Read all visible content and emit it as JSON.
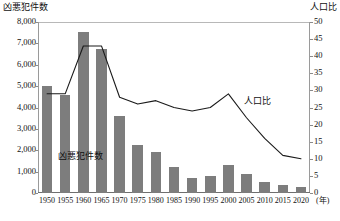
{
  "chart_data": {
    "type": "bar",
    "title": "",
    "xlabel": "(年)",
    "ylabel": "凶悪犯件数",
    "y2label": "人口比",
    "ylim": [
      0,
      8000
    ],
    "y2lim": [
      0,
      50
    ],
    "grid": false,
    "legend_position": "inline-annotation",
    "categories": [
      "1950",
      "1955",
      "1960",
      "1965",
      "1970",
      "1975",
      "1980",
      "1985",
      "1990",
      "1995",
      "2000",
      "2005",
      "2010",
      "2015",
      "2020"
    ],
    "yticks_left": [
      "0",
      "1,000",
      "2,000",
      "3,000",
      "4,000",
      "5,000",
      "6,000",
      "7,000",
      "8,000"
    ],
    "yticks_right": [
      "0",
      "5",
      "10",
      "15",
      "20",
      "25",
      "30",
      "35",
      "40",
      "45",
      "50"
    ],
    "series": [
      {
        "name": "凶悪犯件数",
        "type": "bar",
        "axis": "left",
        "color": "#7d7d7d",
        "values": [
          5000,
          4600,
          7550,
          6750,
          3600,
          2250,
          1900,
          1200,
          700,
          800,
          1300,
          900,
          500,
          380,
          300
        ]
      },
      {
        "name": "人口比",
        "type": "line",
        "axis": "right",
        "color": "#1a1a1a",
        "values": [
          29,
          29,
          43,
          43,
          28,
          26,
          27,
          25,
          24,
          25,
          29,
          22,
          16,
          11,
          10
        ]
      }
    ],
    "annotations": [
      {
        "text": "凶悪犯件数",
        "target": "bar-series"
      },
      {
        "text": "人口比",
        "target": "line-series"
      }
    ]
  },
  "axes": {
    "left_title": "凶悪犯件数",
    "right_title": "人口比",
    "x_unit": "(年)"
  },
  "labels": {
    "bar_series_inline": "凶悪犯件数",
    "line_series_inline": "人口比"
  }
}
